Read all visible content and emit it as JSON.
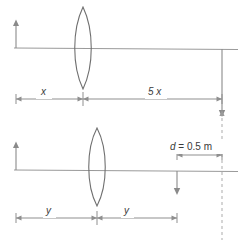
{
  "figure": {
    "colors": {
      "line": "#8a8a8a",
      "lens": "#6f6f6f",
      "dimension": "#8f8f8f",
      "dashed": "#a8a8a8",
      "text": "#3a3a3a",
      "background": "#ffffff"
    },
    "labels": {
      "object_distance_top": "x",
      "image_distance_top": "5 x",
      "object_distance_bottom": "y",
      "image_distance_bottom": "y",
      "separation": "d = 0.5 m",
      "separation_symbol": "d",
      "separation_value": "0.5 m"
    },
    "diagrams": [
      {
        "name": "top-diagram",
        "object_height_label": "upright object arrow",
        "image_height_label": "inverted image arrow",
        "dimensions": [
          "x",
          "5 x"
        ]
      },
      {
        "name": "bottom-diagram",
        "object_height_label": "upright object arrow",
        "image_height_label": "inverted image arrow",
        "dimensions": [
          "y",
          "y",
          "d = 0.5 m"
        ]
      }
    ]
  }
}
